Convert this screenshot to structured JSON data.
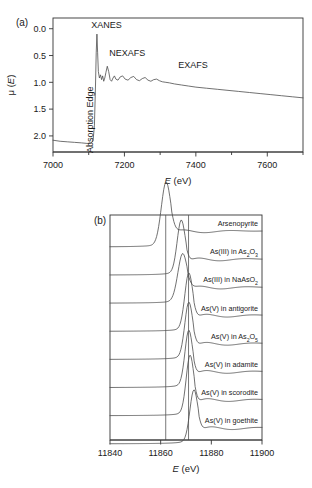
{
  "figure": {
    "panels": [
      {
        "tag": "(a)",
        "xlabel_italic": "E",
        "xlabel_unit": "(eV)",
        "ylabel": "μ (E)",
        "xticks": [
          "7000",
          "7200",
          "7400",
          "7600"
        ],
        "yticks": [
          "2.0",
          "1.5",
          "1.0",
          "0.5",
          "0.0"
        ],
        "annotations": {
          "xanes": "XANES",
          "nexafs": "NEXAFS",
          "exafs": "EXAFS",
          "absorption_edge": "Absorption Edge"
        }
      },
      {
        "tag": "(b)",
        "xlabel_italic": "E",
        "xlabel_unit": "(eV)",
        "xticks": [
          "11840",
          "11860",
          "11880",
          "11900"
        ],
        "spectra": [
          {
            "label_main": "Arsenopyrite",
            "label_sub": "",
            "label_tail": ""
          },
          {
            "label_main": "As(III) in As",
            "label_sub": "2",
            "label_mid": "O",
            "label_sub2": "3",
            "label_tail": ""
          },
          {
            "label_main": "As(III) in NaAsO",
            "label_sub": "2",
            "label_tail": ""
          },
          {
            "label_main": "As(V) in antigorite",
            "label_sub": "",
            "label_tail": ""
          },
          {
            "label_main": "As(V) in As",
            "label_sub": "2",
            "label_mid": "O",
            "label_sub2": "5",
            "label_tail": ""
          },
          {
            "label_main": "As(V) in adamite",
            "label_sub": "",
            "label_tail": ""
          },
          {
            "label_main": "As(V) in scorodite",
            "label_sub": "",
            "label_tail": ""
          },
          {
            "label_main": "As(V) in goethite",
            "label_sub": "",
            "label_tail": ""
          }
        ]
      }
    ]
  },
  "chart_data": [
    {
      "type": "line",
      "title": "",
      "xlabel": "E (eV)",
      "ylabel": "μ (E)",
      "xlim": [
        7000,
        7700
      ],
      "ylim": [
        -0.3,
        2.2
      ],
      "xticks": [
        7000,
        7200,
        7400,
        7600
      ],
      "yticks": [
        0.0,
        0.5,
        1.0,
        1.5,
        2.0
      ],
      "grid": false,
      "legend": "none",
      "annotations": [
        {
          "text": "XANES",
          "x": 7150,
          "y": 2.05
        },
        {
          "text": "NEXAFS",
          "x": 7205,
          "y": 1.52
        },
        {
          "text": "EXAFS",
          "x": 7390,
          "y": 1.28
        },
        {
          "text": "Absorption Edge",
          "x": 7110,
          "y": 0.75,
          "rotation": -90
        }
      ],
      "series": [
        {
          "name": "As K-edge XAFS spectrum",
          "x": [
            7000,
            7020,
            7040,
            7060,
            7080,
            7095,
            7105,
            7112,
            7116,
            7119,
            7121,
            7123,
            7125,
            7127,
            7130,
            7133,
            7136,
            7139,
            7142,
            7145,
            7148,
            7152,
            7156,
            7160,
            7164,
            7168,
            7172,
            7176,
            7182,
            7188,
            7195,
            7202,
            7210,
            7218,
            7226,
            7234,
            7242,
            7250,
            7258,
            7266,
            7274,
            7282,
            7290,
            7298,
            7306,
            7316,
            7326,
            7340,
            7360,
            7380,
            7400,
            7430,
            7460,
            7490,
            7520,
            7550,
            7580,
            7610,
            7640,
            7670,
            7700
          ],
          "y": [
            -0.08,
            -0.1,
            -0.11,
            -0.12,
            -0.13,
            -0.14,
            -0.14,
            -0.1,
            0.2,
            0.95,
            1.55,
            1.9,
            1.55,
            1.2,
            1.08,
            1.14,
            1.05,
            1.12,
            1.02,
            1.08,
            1.18,
            1.3,
            1.2,
            1.05,
            1.02,
            1.08,
            1.12,
            1.06,
            1.04,
            1.1,
            1.12,
            1.06,
            1.04,
            1.09,
            1.11,
            1.05,
            1.03,
            1.07,
            1.09,
            1.04,
            1.02,
            1.05,
            1.06,
            1.03,
            1.01,
            1.0,
            0.99,
            0.97,
            0.95,
            0.93,
            0.91,
            0.89,
            0.87,
            0.85,
            0.83,
            0.81,
            0.79,
            0.77,
            0.75,
            0.73,
            0.71
          ]
        }
      ]
    },
    {
      "type": "line",
      "title": "",
      "xlabel": "E (eV)",
      "ylabel": "",
      "xlim": [
        11840,
        11900
      ],
      "xticks": [
        11840,
        11860,
        11880,
        11900
      ],
      "grid": false,
      "legend": "inline-right-labels",
      "vertical_reference_lines": [
        11862,
        11871
      ],
      "series": [
        {
          "name": "Arsenopyrite",
          "peak_energy": 11862,
          "peak_height": 1.0,
          "peak_width": 2.6
        },
        {
          "name": "As(III) in As2O3",
          "peak_energy": 11868,
          "peak_height": 0.82,
          "peak_width": 2.2
        },
        {
          "name": "As(III) in NaAsO2",
          "peak_energy": 11868.5,
          "peak_height": 0.72,
          "peak_width": 2.6
        },
        {
          "name": "As(V) in antigorite",
          "peak_energy": 11871,
          "peak_height": 0.88,
          "peak_width": 2.2
        },
        {
          "name": "As(V) in As2O5",
          "peak_energy": 11871,
          "peak_height": 0.86,
          "peak_width": 2.2
        },
        {
          "name": "As(V) in adamite",
          "peak_energy": 11871,
          "peak_height": 0.86,
          "peak_width": 2.1
        },
        {
          "name": "As(V) in scorodite",
          "peak_energy": 11871.5,
          "peak_height": 0.92,
          "peak_width": 2.1
        },
        {
          "name": "As(V) in goethite",
          "peak_energy": 11873,
          "peak_height": 0.8,
          "peak_width": 2.2
        }
      ]
    }
  ]
}
